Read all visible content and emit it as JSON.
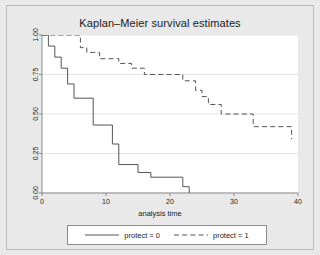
{
  "chart_data": {
    "type": "line",
    "title": "Kaplan–Meier survival estimates",
    "xlabel": "analysis time",
    "ylabel": "",
    "xlim": [
      0,
      40
    ],
    "ylim": [
      0,
      1
    ],
    "grid": true,
    "grid_axis": "y",
    "legend_position": "bottom",
    "xticks": [
      0,
      10,
      20,
      30,
      40
    ],
    "xtick_labels": [
      "0",
      "10",
      "20",
      "30",
      "40"
    ],
    "yticks": [
      0.0,
      0.25,
      0.5,
      0.75,
      1.0
    ],
    "ytick_labels": [
      "0.00",
      "0.25",
      "0.50",
      "0.75",
      "1.00"
    ],
    "series": [
      {
        "name": "protect = 0",
        "style": "solid",
        "color": "#555555",
        "step": "post",
        "x": [
          0,
          1,
          2,
          3,
          4,
          5,
          8,
          11,
          12,
          15,
          17,
          22,
          23
        ],
        "y": [
          1.0,
          0.93,
          0.86,
          0.79,
          0.69,
          0.6,
          0.43,
          0.31,
          0.18,
          0.13,
          0.1,
          0.04,
          0.0
        ]
      },
      {
        "name": "protect = 1",
        "style": "dashed",
        "color": "#555555",
        "step": "post",
        "x": [
          0,
          6,
          7,
          9,
          12,
          14,
          16,
          22,
          24,
          25,
          26,
          28,
          33,
          39
        ],
        "y": [
          1.0,
          0.92,
          0.89,
          0.85,
          0.82,
          0.79,
          0.75,
          0.71,
          0.65,
          0.61,
          0.56,
          0.5,
          0.42,
          0.34
        ]
      }
    ]
  },
  "legend": {
    "entries": [
      {
        "label": "protect = 0",
        "style": "solid"
      },
      {
        "label": "protect = 1",
        "style": "dashed"
      }
    ]
  },
  "colors": {
    "figure_background": "#e9e9e9",
    "plot_background": "#ffffff",
    "line": "#555555",
    "grid": "#e4e4e4",
    "axis": "#8c8c8c",
    "text": "#1a1a1a"
  }
}
